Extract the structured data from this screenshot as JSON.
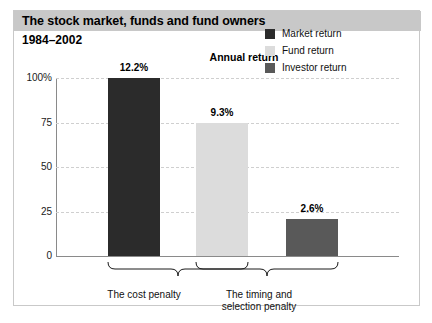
{
  "header": {
    "title": "The stock market, funds and fund owners",
    "subtitle": "1984–2002",
    "band_color": "#c8c8c8"
  },
  "chart_data": {
    "type": "bar",
    "title": "Annual return",
    "xlabel": "",
    "ylabel": "",
    "categories": [
      "Market return",
      "Fund return",
      "Investor return"
    ],
    "values": [
      12.2,
      9.3,
      2.6
    ],
    "value_labels": [
      "12.2%",
      "9.3%",
      "2.6%"
    ],
    "bar_colors": [
      "#2b2b2b",
      "#dcdcdc",
      "#595959"
    ],
    "axis": {
      "ticks": [
        0,
        25,
        50,
        75,
        100
      ],
      "tick_labels": [
        "0",
        "25",
        "50",
        "75",
        "100%"
      ],
      "ylim": [
        0,
        100
      ],
      "grid": true,
      "grid_style": "dashed"
    },
    "bar_scale_percent_of_axis": [
      100,
      75,
      21
    ],
    "legend": {
      "position": "top-right",
      "entries": [
        {
          "label": "Market return",
          "color": "#2b2b2b"
        },
        {
          "label": "Fund return",
          "color": "#dcdcdc"
        },
        {
          "label": "Investor return",
          "color": "#595959"
        }
      ]
    },
    "annotations": [
      {
        "label": "The cost penalty",
        "spans": [
          "Market return",
          "Fund return"
        ]
      },
      {
        "label": "The timing and\nselection penalty",
        "spans": [
          "Fund return",
          "Investor return"
        ]
      }
    ]
  },
  "annotation_labels": {
    "cost_penalty": "The cost penalty",
    "timing_penalty_line1": "The timing and",
    "timing_penalty_line2": "selection penalty"
  }
}
